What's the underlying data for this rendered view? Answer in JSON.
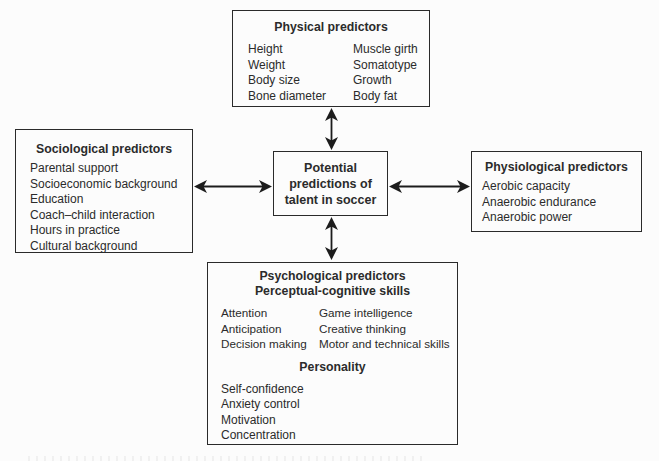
{
  "colors": {
    "background": "#fcfcfc",
    "box_border": "#2a2a2a",
    "text": "#2b2b2b",
    "arrow": "#1c1c1c"
  },
  "boxes": {
    "physical": {
      "title": "Physical predictors",
      "left_column": [
        "Height",
        "Weight",
        "Body size",
        "Bone diameter"
      ],
      "right_column": [
        "Muscle girth",
        "Somatotype",
        "Growth",
        "Body fat"
      ]
    },
    "sociological": {
      "title": "Sociological predictors",
      "items": [
        "Parental support",
        "Socioeconomic background",
        "Education",
        "Coach–child interaction",
        "Hours in practice",
        "Cultural background"
      ]
    },
    "center": {
      "lines": [
        "Potential",
        "predictions of",
        "talent in soccer"
      ]
    },
    "physiological": {
      "title": "Physiological predictors",
      "items": [
        "Aerobic capacity",
        "Anaerobic endurance",
        "Anaerobic power"
      ]
    },
    "psychological": {
      "title": "Psychological predictors",
      "subtitle": "Perceptual-cognitive skills",
      "left_column": [
        "Attention",
        "Anticipation",
        "Decision making"
      ],
      "right_column": [
        "Game intelligence",
        "Creative thinking",
        "Motor and technical skills"
      ],
      "personality": {
        "title": "Personality",
        "items": [
          "Self-confidence",
          "Anxiety control",
          "Motivation",
          "Concentration"
        ]
      }
    }
  }
}
